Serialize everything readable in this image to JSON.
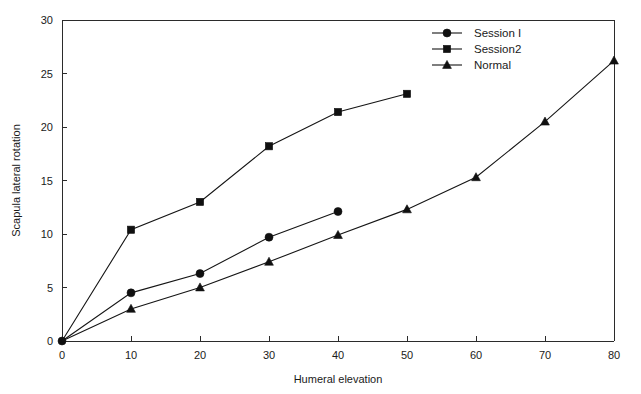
{
  "chart_data": {
    "type": "line",
    "title": "",
    "xlabel": "Humeral elevation",
    "ylabel": "Scapula lateral rotation",
    "xlim": [
      0,
      80
    ],
    "ylim": [
      0,
      30
    ],
    "xticks": [
      0,
      10,
      20,
      30,
      40,
      50,
      60,
      70,
      80
    ],
    "yticks": [
      0,
      5,
      10,
      15,
      20,
      25,
      30
    ],
    "xtick_labels": [
      "0",
      "10",
      "20",
      "30",
      "40",
      "50",
      "60",
      "70",
      "80"
    ],
    "ytick_labels": [
      "0",
      "5",
      "10",
      "15",
      "20",
      "25",
      "30"
    ],
    "grid": false,
    "legend_position": "top-right",
    "series": [
      {
        "name": "Session I",
        "marker": "circle",
        "x": [
          0,
          10,
          20,
          30,
          40
        ],
        "values": [
          0,
          4.5,
          6.3,
          9.7,
          12.1
        ]
      },
      {
        "name": "Session2",
        "marker": "square",
        "x": [
          0,
          10,
          20,
          30,
          40,
          50
        ],
        "values": [
          0,
          10.4,
          13.0,
          18.2,
          21.4,
          23.1
        ]
      },
      {
        "name": "Normal",
        "marker": "triangle",
        "x": [
          0,
          10,
          20,
          30,
          40,
          50,
          60,
          70,
          80
        ],
        "values": [
          0,
          3.0,
          5.0,
          7.4,
          9.9,
          12.3,
          15.3,
          20.5,
          26.2
        ]
      }
    ]
  },
  "legend": {
    "entries": [
      {
        "label": "Session I"
      },
      {
        "label": "Session2"
      },
      {
        "label": "Normal"
      }
    ]
  },
  "colors": {
    "ink": "#151515",
    "axis": "#2b2b2b",
    "background": "#ffffff"
  }
}
